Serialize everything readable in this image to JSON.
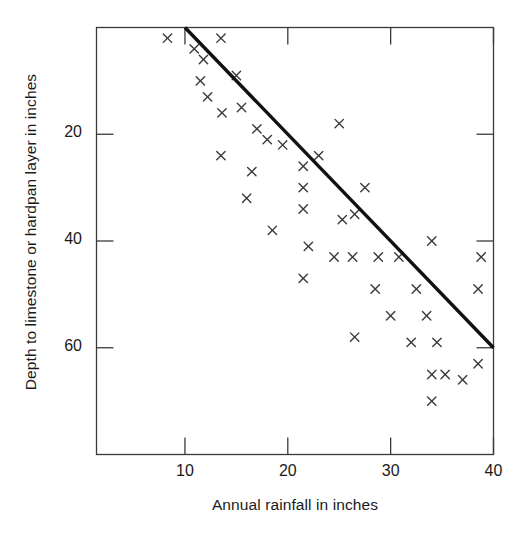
{
  "chart_data": {
    "type": "scatter",
    "title": "",
    "xlabel": "Annual rainfall in inches",
    "ylabel": "Depth to limestone or hardpan layer in inches",
    "xlim": [
      1.4,
      40
    ],
    "ylim": [
      80,
      0
    ],
    "y_axis_inverted": true,
    "grid": false,
    "legend": null,
    "marker": "x",
    "marker_color": "#3a3a3a",
    "frame_color": "#3a3a3a",
    "xticks": [
      10,
      20,
      30,
      40
    ],
    "xtick_labels": [
      "10",
      "20",
      "30",
      "40"
    ],
    "yticks": [
      20,
      40,
      60
    ],
    "ytick_labels": [
      "20",
      "40",
      "60"
    ],
    "points": [
      {
        "x": 8.3,
        "y": 2
      },
      {
        "x": 10.9,
        "y": 4
      },
      {
        "x": 11.8,
        "y": 6
      },
      {
        "x": 13.5,
        "y": 2
      },
      {
        "x": 11.5,
        "y": 10
      },
      {
        "x": 12.2,
        "y": 13
      },
      {
        "x": 13.6,
        "y": 16
      },
      {
        "x": 15.0,
        "y": 9
      },
      {
        "x": 15.5,
        "y": 15
      },
      {
        "x": 17.0,
        "y": 19
      },
      {
        "x": 18.0,
        "y": 21
      },
      {
        "x": 13.5,
        "y": 24
      },
      {
        "x": 19.5,
        "y": 22
      },
      {
        "x": 25.0,
        "y": 18
      },
      {
        "x": 21.5,
        "y": 26
      },
      {
        "x": 16.5,
        "y": 27
      },
      {
        "x": 23.0,
        "y": 24
      },
      {
        "x": 16.0,
        "y": 32
      },
      {
        "x": 21.5,
        "y": 30
      },
      {
        "x": 27.5,
        "y": 30
      },
      {
        "x": 21.5,
        "y": 34
      },
      {
        "x": 18.5,
        "y": 38
      },
      {
        "x": 25.3,
        "y": 36
      },
      {
        "x": 26.5,
        "y": 35
      },
      {
        "x": 22.0,
        "y": 41
      },
      {
        "x": 24.5,
        "y": 43
      },
      {
        "x": 26.3,
        "y": 43
      },
      {
        "x": 28.8,
        "y": 43
      },
      {
        "x": 30.8,
        "y": 43
      },
      {
        "x": 34.0,
        "y": 40
      },
      {
        "x": 38.8,
        "y": 43
      },
      {
        "x": 21.5,
        "y": 47
      },
      {
        "x": 28.5,
        "y": 49
      },
      {
        "x": 32.5,
        "y": 49
      },
      {
        "x": 38.5,
        "y": 49
      },
      {
        "x": 30.0,
        "y": 54
      },
      {
        "x": 33.5,
        "y": 54
      },
      {
        "x": 26.5,
        "y": 58
      },
      {
        "x": 32.0,
        "y": 59
      },
      {
        "x": 34.5,
        "y": 59
      },
      {
        "x": 34.0,
        "y": 65
      },
      {
        "x": 35.3,
        "y": 65
      },
      {
        "x": 34.0,
        "y": 70
      },
      {
        "x": 37.0,
        "y": 66
      },
      {
        "x": 38.5,
        "y": 63
      }
    ],
    "trend_line": {
      "x1": 10,
      "y1": 0,
      "x2": 40,
      "y2": 60,
      "color": "#111111",
      "width": 3.4
    }
  }
}
